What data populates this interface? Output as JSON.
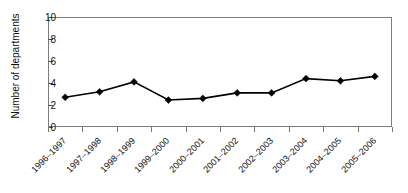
{
  "chart_data": {
    "type": "line",
    "title": "",
    "xlabel": "",
    "ylabel": "Number of departments",
    "categories": [
      "1996–1997",
      "1997–1998",
      "1998–1999",
      "1999–2000",
      "2000–2001",
      "2001–2002",
      "2002–2003",
      "2003–2004",
      "2004–2005",
      "2005–2006"
    ],
    "values": [
      2.7,
      3.2,
      4.1,
      2.45,
      2.6,
      3.1,
      3.1,
      4.4,
      4.2,
      4.6
    ],
    "ylim": [
      0,
      10
    ],
    "yticks": [
      0,
      2,
      4,
      6,
      8,
      10
    ],
    "grid": false,
    "legend": null,
    "marker": "diamond",
    "series_color": "#000000",
    "frame_color": "#7d7d7d"
  },
  "axes": {
    "y_title": "Number of departments",
    "y_tick_labels": [
      "0",
      "2",
      "4",
      "6",
      "8",
      "10"
    ],
    "x_tick_labels": [
      "1996–1997",
      "1997–1998",
      "1998–1999",
      "1999–2000",
      "2000–2001",
      "2001–2002",
      "2002–2003",
      "2003–2004",
      "2004–2005",
      "2005–2006"
    ]
  }
}
